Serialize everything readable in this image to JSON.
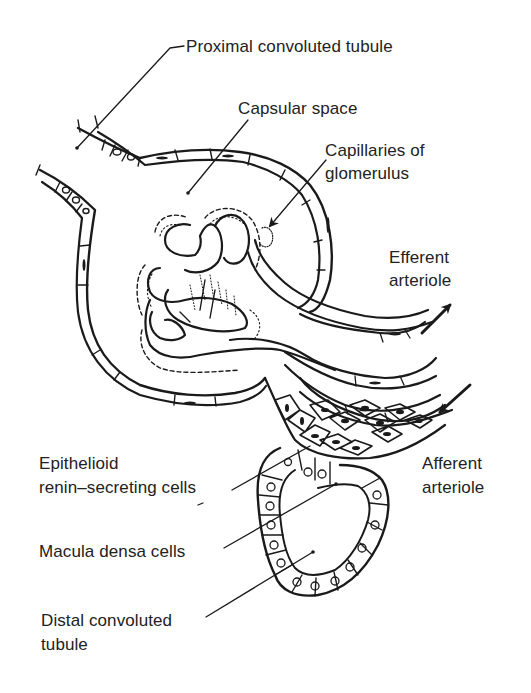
{
  "diagram": {
    "colors": {
      "ink": "#1a1a1a",
      "background": "#ffffff",
      "text": "#222222"
    },
    "labels": [
      {
        "id": "proximal",
        "text": "Proximal convoluted tubule",
        "x": 186,
        "y": 36
      },
      {
        "id": "capsular",
        "text": "Capsular space",
        "x": 238,
        "y": 98
      },
      {
        "id": "capillaries_1",
        "text": "Capillaries of",
        "x": 325,
        "y": 140
      },
      {
        "id": "capillaries_2",
        "text": "glomerulus",
        "x": 325,
        "y": 163
      },
      {
        "id": "efferent_1",
        "text": "Efferent",
        "x": 389,
        "y": 247
      },
      {
        "id": "efferent_2",
        "text": "arteriole",
        "x": 389,
        "y": 270
      },
      {
        "id": "epithelioid_1",
        "text": "Epithelioid",
        "x": 39,
        "y": 453
      },
      {
        "id": "epithelioid_2",
        "text": "renin–secreting cells",
        "x": 39,
        "y": 477
      },
      {
        "id": "afferent_1",
        "text": "Afferent",
        "x": 422,
        "y": 453
      },
      {
        "id": "afferent_2",
        "text": "arteriole",
        "x": 422,
        "y": 477
      },
      {
        "id": "macula",
        "text": "Macula densa cells",
        "x": 39,
        "y": 541
      },
      {
        "id": "distal_1",
        "text": "Distal convoluted",
        "x": 41,
        "y": 610
      },
      {
        "id": "distal_2",
        "text": "tubule",
        "x": 41,
        "y": 634
      }
    ],
    "arrows": [
      {
        "name": "efferent-flow-arrow",
        "direction": "outward (up-right)"
      },
      {
        "name": "afferent-flow-arrow",
        "direction": "inward (down-left)"
      },
      {
        "name": "capillaries-pointer-arrow",
        "direction": "down-left"
      }
    ]
  }
}
